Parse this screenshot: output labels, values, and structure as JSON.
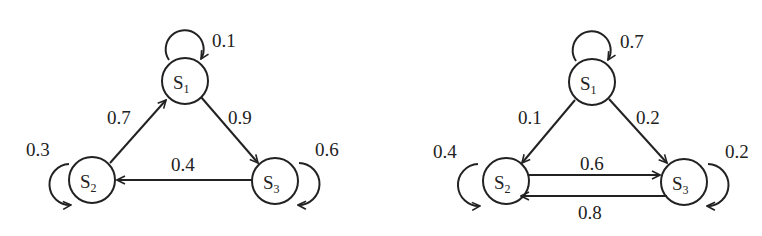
{
  "diagrams": [
    {
      "name": "markov-chain-left",
      "states": [
        {
          "id": "S1",
          "label": "S",
          "sub": "1",
          "x": 185,
          "y": 81
        },
        {
          "id": "S2",
          "label": "S",
          "sub": "2",
          "x": 92,
          "y": 180
        },
        {
          "id": "S3",
          "label": "S",
          "sub": "3",
          "x": 275,
          "y": 181
        }
      ],
      "transitions": [
        {
          "from": "S1",
          "to": "S1",
          "p": "0.1"
        },
        {
          "from": "S2",
          "to": "S1",
          "p": "0.7"
        },
        {
          "from": "S1",
          "to": "S3",
          "p": "0.9"
        },
        {
          "from": "S3",
          "to": "S2",
          "p": "0.4"
        },
        {
          "from": "S2",
          "to": "S2",
          "p": "0.3"
        },
        {
          "from": "S3",
          "to": "S3",
          "p": "0.6"
        }
      ]
    },
    {
      "name": "markov-chain-right",
      "states": [
        {
          "id": "S1",
          "label": "S",
          "sub": "1",
          "x": 592,
          "y": 82
        },
        {
          "id": "S2",
          "label": "S",
          "sub": "2",
          "x": 506,
          "y": 181
        },
        {
          "id": "S3",
          "label": "S",
          "sub": "3",
          "x": 684,
          "y": 182
        }
      ],
      "transitions": [
        {
          "from": "S1",
          "to": "S1",
          "p": "0.7"
        },
        {
          "from": "S1",
          "to": "S2",
          "p": "0.1"
        },
        {
          "from": "S1",
          "to": "S3",
          "p": "0.2"
        },
        {
          "from": "S2",
          "to": "S3",
          "p": "0.6"
        },
        {
          "from": "S3",
          "to": "S2",
          "p": "0.8"
        },
        {
          "from": "S2",
          "to": "S2",
          "p": "0.4"
        },
        {
          "from": "S3",
          "to": "S3",
          "p": "0.2"
        }
      ]
    }
  ]
}
